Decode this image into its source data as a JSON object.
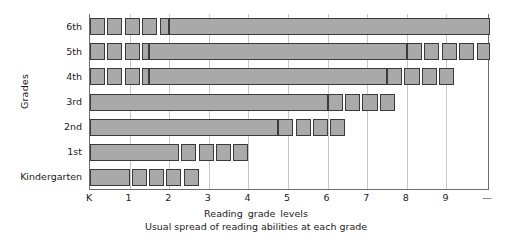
{
  "chart_data": {
    "type": "bar",
    "title": "",
    "xlabel": "Reading  grade  levels",
    "ylabel": "Grades",
    "caption": "Usual spread of reading abilities at each grade",
    "grid": true,
    "legend": "none",
    "xlim": [
      0,
      10.1
    ],
    "xtick_labels": [
      "K",
      "1",
      "2",
      "3",
      "4",
      "5",
      "6",
      "7",
      "8",
      "9",
      "—"
    ],
    "xtick_values": [
      0,
      1,
      2,
      3,
      4,
      5,
      6,
      7,
      8,
      9,
      10.05
    ],
    "categories": [
      "6th",
      "5th",
      "4th",
      "3rd",
      "2nd",
      "1st",
      "Kindergarten"
    ],
    "series": [
      {
        "name": "6th",
        "core": [
          2.0,
          10.1
        ],
        "blocks": [
          [
            0.0,
            0.38
          ],
          [
            0.44,
            0.82
          ],
          [
            0.88,
            1.26
          ],
          [
            1.32,
            1.7
          ],
          [
            1.76,
            2.0
          ]
        ]
      },
      {
        "name": "5th",
        "core": [
          1.5,
          8.0
        ],
        "blocks": [
          [
            0.0,
            0.38
          ],
          [
            0.44,
            0.82
          ],
          [
            0.88,
            1.26
          ],
          [
            1.32,
            1.5
          ],
          [
            8.0,
            8.38
          ],
          [
            8.44,
            8.82
          ],
          [
            8.88,
            9.26
          ],
          [
            9.32,
            9.7
          ],
          [
            9.76,
            10.1
          ]
        ]
      },
      {
        "name": "4th",
        "core": [
          1.5,
          7.5
        ],
        "blocks": [
          [
            0.0,
            0.38
          ],
          [
            0.44,
            0.82
          ],
          [
            0.88,
            1.26
          ],
          [
            1.32,
            1.5
          ],
          [
            7.5,
            7.88
          ],
          [
            7.94,
            8.32
          ],
          [
            8.38,
            8.76
          ],
          [
            8.82,
            9.2
          ]
        ]
      },
      {
        "name": "3rd",
        "core": [
          0.0,
          6.0
        ],
        "blocks": [
          [
            6.0,
            6.38
          ],
          [
            6.44,
            6.82
          ],
          [
            6.88,
            7.26
          ],
          [
            7.32,
            7.7
          ]
        ]
      },
      {
        "name": "2nd",
        "core": [
          0.0,
          4.75
        ],
        "blocks": [
          [
            4.75,
            5.13
          ],
          [
            5.19,
            5.57
          ],
          [
            5.63,
            6.01
          ],
          [
            6.07,
            6.45
          ]
        ]
      },
      {
        "name": "1st",
        "core": [
          0.0,
          2.25
        ],
        "blocks": [
          [
            2.3,
            2.68
          ],
          [
            2.74,
            3.12
          ],
          [
            3.18,
            3.56
          ],
          [
            3.62,
            4.0
          ]
        ]
      },
      {
        "name": "Kindergarten",
        "core": [
          0.0,
          1.0
        ],
        "blocks": [
          [
            1.05,
            1.43
          ],
          [
            1.49,
            1.87
          ],
          [
            1.93,
            2.31
          ],
          [
            2.37,
            2.75
          ]
        ]
      }
    ],
    "colors": {
      "bar_fill": "#a9a9a9",
      "bar_stroke": "#3a3a3a",
      "grid": "#c9c9c9",
      "axis": "#6d6d6d",
      "text": "#1a1a1a"
    }
  }
}
